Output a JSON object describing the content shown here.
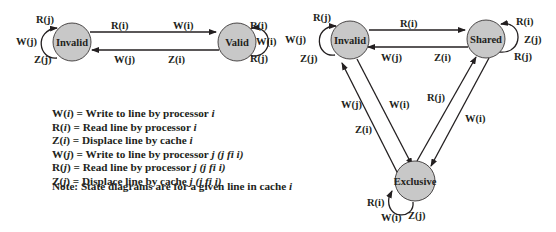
{
  "left_diagram": {
    "nodes": {
      "invalid": {
        "label": "Invalid"
      },
      "valid": {
        "label": "Valid"
      }
    },
    "edges": {
      "invalid_to_valid_start": "R(i)",
      "invalid_to_valid_end": "W(i)",
      "valid_to_invalid_start": "Z(i)",
      "valid_to_invalid_end": "W(j)"
    },
    "self_loops": {
      "invalid": [
        "R(j)",
        "W(j)",
        "Z(j)"
      ],
      "valid": [
        "R(i)",
        "W(i)",
        "R(j)"
      ]
    }
  },
  "right_diagram": {
    "nodes": {
      "invalid": {
        "label": "Invalid"
      },
      "shared": {
        "label": "Shared"
      },
      "exclusive": {
        "label": "Exclusive"
      }
    },
    "edges": {
      "invalid_to_shared": "R(i)",
      "shared_to_invalid_1": "W(j)",
      "shared_to_invalid_2": "Z(i)",
      "exclusive_to_invalid_1": "W(j)",
      "exclusive_to_invalid_2": "Z(i)",
      "invalid_to_exclusive": "W(i)",
      "exclusive_to_shared": "R(j)",
      "shared_to_exclusive": "W(i)"
    },
    "self_loops": {
      "invalid": [
        "R(j)",
        "W(j)",
        "Z(j)"
      ],
      "shared": [
        "R(i)",
        "Z(j)",
        "R(j)"
      ],
      "exclusive": [
        "R(i)",
        "W(i)",
        "Z(j)"
      ]
    }
  },
  "legend": {
    "items": [
      {
        "sym": "W",
        "arg": "i",
        "sep": " = ",
        "text": "Write to line by processor ",
        "var": "i",
        "extra": ""
      },
      {
        "sym": "R",
        "arg": "i",
        "sep": "  = ",
        "text": "Read line by processor ",
        "var": "i",
        "extra": ""
      },
      {
        "sym": "Z",
        "arg": "i",
        "sep": "  = ",
        "text": "Displace line by cache ",
        "var": "i",
        "extra": ""
      },
      {
        "sym": "W",
        "arg": "j",
        "sep": " = ",
        "text": "Write to line by processor ",
        "var": "j",
        "extra": " (j fi i)"
      },
      {
        "sym": "R",
        "arg": "j",
        "sep": " = ",
        "text": "Read line by processor ",
        "var": "j",
        "extra": " (j fi i)"
      },
      {
        "sym": "Z",
        "arg": "j",
        "sep": " = ",
        "text": "Displace line by cache ",
        "var": "j",
        "extra": " (j fi i)"
      }
    ],
    "note_prefix": "Note: State diagrams are for a given line in cache ",
    "note_var": "i"
  },
  "colors": {
    "node_fill": "#c8c8c8",
    "stroke": "#231f20",
    "background": "#ffffff"
  }
}
